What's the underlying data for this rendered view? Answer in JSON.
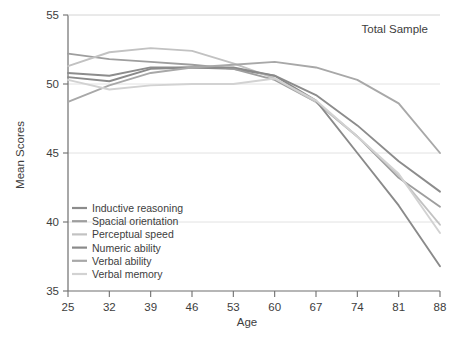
{
  "chart_data": {
    "type": "line",
    "title": "",
    "annotation": "Total Sample",
    "xlabel": "Age",
    "ylabel": "Mean Scores",
    "categories": [
      25,
      32,
      39,
      46,
      53,
      60,
      67,
      74,
      81,
      88
    ],
    "x": [
      25,
      32,
      39,
      46,
      53,
      60,
      67,
      74,
      81,
      88
    ],
    "xlim": [
      25,
      88
    ],
    "ylim": [
      35,
      55
    ],
    "xticks": [
      "25",
      "32",
      "39",
      "46",
      "53",
      "60",
      "67",
      "74",
      "81",
      "88"
    ],
    "yticks": [
      "35",
      "40",
      "45",
      "50",
      "55"
    ],
    "grid": true,
    "legend_position": "bottom-left",
    "series": [
      {
        "name": "Inductive reasoning",
        "color": "#8c8c8c",
        "values": [
          50.8,
          50.6,
          51.2,
          51.2,
          51.1,
          50.6,
          49.2,
          47.0,
          44.4,
          42.2
        ]
      },
      {
        "name": "Spacial orientation",
        "color": "#9e9e9e",
        "values": [
          52.2,
          51.8,
          51.6,
          51.4,
          51.1,
          50.3,
          48.7,
          46.2,
          43.2,
          41.1
        ]
      },
      {
        "name": "Perceptual speed",
        "color": "#c2c2c2",
        "values": [
          51.3,
          52.3,
          52.6,
          52.4,
          51.5,
          50.4,
          48.7,
          46.2,
          43.4,
          39.8
        ]
      },
      {
        "name": "Numeric ability",
        "color": "#8a8a8a",
        "values": [
          50.5,
          50.2,
          51.1,
          51.2,
          51.2,
          50.6,
          48.8,
          45.0,
          41.2,
          36.8
        ]
      },
      {
        "name": "Verbal ability",
        "color": "#a8a8a8",
        "values": [
          48.7,
          49.9,
          50.8,
          51.2,
          51.4,
          51.6,
          51.2,
          50.3,
          48.6,
          45.0
        ]
      },
      {
        "name": "Verbal memory",
        "color": "#d2d2d2",
        "values": [
          50.3,
          49.6,
          49.9,
          50.0,
          50.0,
          50.4,
          48.8,
          46.2,
          43.5,
          39.2
        ]
      }
    ]
  },
  "axes": {
    "x_title": "Age",
    "y_title": "Mean Scores"
  },
  "annotation": {
    "text": "Total Sample"
  },
  "legend": {
    "items": [
      {
        "label": "Inductive reasoning",
        "color": "#8c8c8c"
      },
      {
        "label": "Spacial orientation",
        "color": "#9e9e9e"
      },
      {
        "label": "Perceptual speed",
        "color": "#c2c2c2"
      },
      {
        "label": "Numeric ability",
        "color": "#8a8a8a"
      },
      {
        "label": "Verbal ability",
        "color": "#a8a8a8"
      },
      {
        "label": "Verbal memory",
        "color": "#d2d2d2"
      }
    ]
  }
}
